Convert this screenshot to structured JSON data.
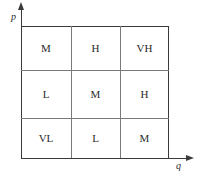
{
  "diagram": {
    "axes": {
      "y_label": "p",
      "x_label": "q"
    },
    "grid": {
      "rows": [
        [
          "M",
          "H",
          "VH"
        ],
        [
          "L",
          "M",
          "H"
        ],
        [
          "VL",
          "L",
          "M"
        ]
      ]
    }
  }
}
